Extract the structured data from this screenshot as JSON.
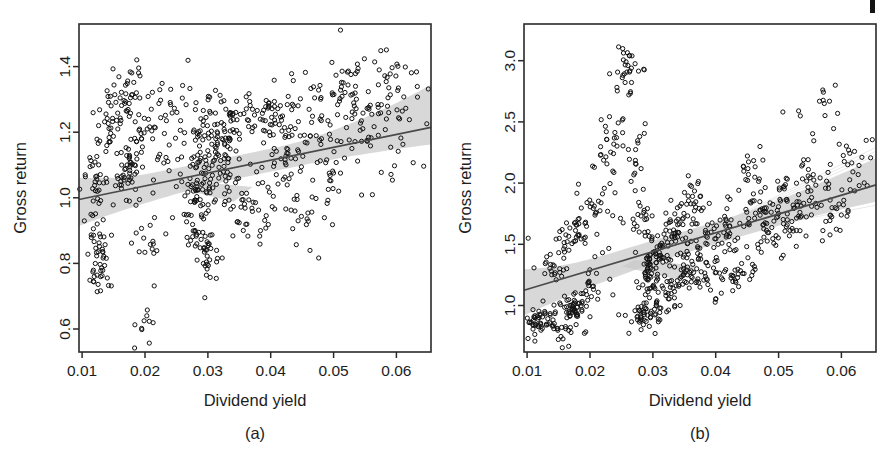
{
  "figure": {
    "background": "#ffffff",
    "point_color": "#121212",
    "line_color": "#4a4a4a",
    "band_color": "#c9c9c9",
    "width": 890,
    "height": 460,
    "scan_artifact": "scan-mark"
  },
  "panels": [
    {
      "id": "a",
      "caption": "(a)",
      "xlabel": "Dividend yield",
      "ylabel": "Gross return"
    },
    {
      "id": "b",
      "caption": "(b)",
      "xlabel": "Dividend yield",
      "ylabel": "Gross return"
    }
  ],
  "chart_data": [
    {
      "type": "scatter",
      "panel": "a",
      "title": "",
      "xlabel": "Dividend yield",
      "ylabel": "Gross return",
      "xlim": [
        0.0095,
        0.0655
      ],
      "ylim": [
        0.53,
        1.53
      ],
      "xticks": [
        0.01,
        0.02,
        0.03,
        0.04,
        0.05,
        0.06
      ],
      "xticklabels": [
        "0.01",
        "0.02",
        "0.03",
        "0.04",
        "0.05",
        "0.06"
      ],
      "yticks": [
        0.6,
        0.8,
        1.0,
        1.2,
        1.4
      ],
      "yticklabels": [
        "0.6",
        "0.8",
        "1.0",
        "1.2",
        "1.4"
      ],
      "grid": false,
      "legend": null,
      "marker": "open-circle",
      "n_points": 620,
      "fit": {
        "type": "linear",
        "x_start": 0.0095,
        "y_start": 0.995,
        "x_end": 0.0655,
        "y_end": 1.215
      },
      "confidence_band": {
        "description": "grey pointwise band around fit, widening at right edge",
        "lower_offset": -0.035,
        "upper_offset": 0.035,
        "right_upper_offset": 0.13
      },
      "clusters": [
        {
          "xc": 0.0118,
          "yc": 1.055,
          "xs": 0.0009,
          "ys": 0.055,
          "n": 26
        },
        {
          "xc": 0.0128,
          "yc": 0.855,
          "xs": 0.001,
          "ys": 0.055,
          "n": 30
        },
        {
          "xc": 0.0125,
          "yc": 0.745,
          "xs": 0.0008,
          "ys": 0.03,
          "n": 14
        },
        {
          "xc": 0.0142,
          "yc": 1.195,
          "xs": 0.001,
          "ys": 0.045,
          "n": 20
        },
        {
          "xc": 0.016,
          "yc": 1.275,
          "xs": 0.0012,
          "ys": 0.06,
          "n": 26
        },
        {
          "xc": 0.0172,
          "yc": 1.075,
          "xs": 0.0011,
          "ys": 0.055,
          "n": 48
        },
        {
          "xc": 0.018,
          "yc": 1.345,
          "xs": 0.0009,
          "ys": 0.045,
          "n": 16
        },
        {
          "xc": 0.0195,
          "yc": 1.245,
          "xs": 0.0013,
          "ys": 0.06,
          "n": 24
        },
        {
          "xc": 0.02,
          "yc": 0.885,
          "xs": 0.0012,
          "ys": 0.05,
          "n": 16
        },
        {
          "xc": 0.0205,
          "yc": 0.615,
          "xs": 0.001,
          "ys": 0.03,
          "n": 10
        },
        {
          "xc": 0.023,
          "yc": 1.175,
          "xs": 0.0014,
          "ys": 0.07,
          "n": 20
        },
        {
          "xc": 0.0255,
          "yc": 1.265,
          "xs": 0.0013,
          "ys": 0.065,
          "n": 16
        },
        {
          "xc": 0.0278,
          "yc": 0.915,
          "xs": 0.0012,
          "ys": 0.06,
          "n": 34
        },
        {
          "xc": 0.0288,
          "yc": 1.095,
          "xs": 0.0011,
          "ys": 0.07,
          "n": 54
        },
        {
          "xc": 0.03,
          "yc": 0.845,
          "xs": 0.0011,
          "ys": 0.055,
          "n": 28
        },
        {
          "xc": 0.0305,
          "yc": 1.245,
          "xs": 0.0013,
          "ys": 0.07,
          "n": 24
        },
        {
          "xc": 0.0318,
          "yc": 1.105,
          "xs": 0.0012,
          "ys": 0.07,
          "n": 46
        },
        {
          "xc": 0.0335,
          "yc": 1.225,
          "xs": 0.0013,
          "ys": 0.06,
          "n": 30
        },
        {
          "xc": 0.035,
          "yc": 0.965,
          "xs": 0.0014,
          "ys": 0.06,
          "n": 22
        },
        {
          "xc": 0.0372,
          "yc": 1.255,
          "xs": 0.0013,
          "ys": 0.06,
          "n": 22
        },
        {
          "xc": 0.0385,
          "yc": 0.965,
          "xs": 0.0013,
          "ys": 0.05,
          "n": 20
        },
        {
          "xc": 0.0405,
          "yc": 1.275,
          "xs": 0.0013,
          "ys": 0.055,
          "n": 26
        },
        {
          "xc": 0.042,
          "yc": 1.105,
          "xs": 0.0014,
          "ys": 0.065,
          "n": 24
        },
        {
          "xc": 0.044,
          "yc": 1.195,
          "xs": 0.0014,
          "ys": 0.06,
          "n": 22
        },
        {
          "xc": 0.0455,
          "yc": 0.955,
          "xs": 0.0014,
          "ys": 0.06,
          "n": 20
        },
        {
          "xc": 0.0478,
          "yc": 1.255,
          "xs": 0.0014,
          "ys": 0.06,
          "n": 22
        },
        {
          "xc": 0.0495,
          "yc": 1.095,
          "xs": 0.0014,
          "ys": 0.07,
          "n": 22
        },
        {
          "xc": 0.052,
          "yc": 1.285,
          "xs": 0.0015,
          "ys": 0.07,
          "n": 24
        },
        {
          "xc": 0.0545,
          "yc": 1.195,
          "xs": 0.0015,
          "ys": 0.075,
          "n": 22
        },
        {
          "xc": 0.0575,
          "yc": 1.325,
          "xs": 0.0016,
          "ys": 0.075,
          "n": 22
        },
        {
          "xc": 0.0605,
          "yc": 1.335,
          "xs": 0.0015,
          "ys": 0.08,
          "n": 20
        }
      ]
    },
    {
      "type": "scatter",
      "panel": "b",
      "title": "",
      "xlabel": "Dividend yield",
      "ylabel": "Gross return",
      "xlim": [
        0.0095,
        0.0655
      ],
      "ylim": [
        0.62,
        3.3
      ],
      "xticks": [
        0.01,
        0.02,
        0.03,
        0.04,
        0.05,
        0.06
      ],
      "xticklabels": [
        "0.01",
        "0.02",
        "0.03",
        "0.04",
        "0.05",
        "0.06"
      ],
      "yticks": [
        1.0,
        1.5,
        2.0,
        2.5,
        3.0
      ],
      "yticklabels": [
        "1.0",
        "1.5",
        "2.0",
        "2.5",
        "3.0"
      ],
      "grid": false,
      "legend": null,
      "marker": "open-circle",
      "n_points": 640,
      "fit": {
        "type": "linear",
        "x_start": 0.0095,
        "y_start": 1.125,
        "x_end": 0.0655,
        "y_end": 1.985
      },
      "confidence_band": {
        "description": "grey pointwise band around fit, widening at both ends",
        "lower_offset": -0.09,
        "upper_offset": 0.09,
        "right_upper_offset": 0.22
      },
      "clusters": [
        {
          "xc": 0.0112,
          "yc": 0.855,
          "xs": 0.0008,
          "ys": 0.045,
          "n": 26
        },
        {
          "xc": 0.0132,
          "yc": 0.905,
          "xs": 0.0009,
          "ys": 0.055,
          "n": 22
        },
        {
          "xc": 0.014,
          "yc": 1.285,
          "xs": 0.001,
          "ys": 0.06,
          "n": 16
        },
        {
          "xc": 0.0155,
          "yc": 0.785,
          "xs": 0.0009,
          "ys": 0.055,
          "n": 18
        },
        {
          "xc": 0.0162,
          "yc": 1.515,
          "xs": 0.0011,
          "ys": 0.08,
          "n": 18
        },
        {
          "xc": 0.0175,
          "yc": 0.975,
          "xs": 0.001,
          "ys": 0.055,
          "n": 44
        },
        {
          "xc": 0.0188,
          "yc": 1.625,
          "xs": 0.0011,
          "ys": 0.09,
          "n": 20
        },
        {
          "xc": 0.0196,
          "yc": 1.165,
          "xs": 0.001,
          "ys": 0.08,
          "n": 18
        },
        {
          "xc": 0.0212,
          "yc": 1.845,
          "xs": 0.0012,
          "ys": 0.1,
          "n": 18
        },
        {
          "xc": 0.0222,
          "yc": 2.165,
          "xs": 0.0009,
          "ys": 0.09,
          "n": 12
        },
        {
          "xc": 0.0235,
          "yc": 2.465,
          "xs": 0.0011,
          "ys": 0.13,
          "n": 14
        },
        {
          "xc": 0.0252,
          "yc": 2.735,
          "xs": 0.001,
          "ys": 0.14,
          "n": 14
        },
        {
          "xc": 0.0265,
          "yc": 2.925,
          "xs": 0.001,
          "ys": 0.17,
          "n": 18
        },
        {
          "xc": 0.0272,
          "yc": 2.285,
          "xs": 0.0009,
          "ys": 0.12,
          "n": 16
        },
        {
          "xc": 0.0278,
          "yc": 0.885,
          "xs": 0.0009,
          "ys": 0.06,
          "n": 24
        },
        {
          "xc": 0.0285,
          "yc": 1.755,
          "xs": 0.001,
          "ys": 0.11,
          "n": 18
        },
        {
          "xc": 0.0292,
          "yc": 1.325,
          "xs": 0.001,
          "ys": 0.09,
          "n": 34
        },
        {
          "xc": 0.03,
          "yc": 0.985,
          "xs": 0.001,
          "ys": 0.08,
          "n": 32
        },
        {
          "xc": 0.0312,
          "yc": 1.455,
          "xs": 0.0011,
          "ys": 0.11,
          "n": 40
        },
        {
          "xc": 0.0325,
          "yc": 1.185,
          "xs": 0.0011,
          "ys": 0.09,
          "n": 26
        },
        {
          "xc": 0.0338,
          "yc": 1.645,
          "xs": 0.0012,
          "ys": 0.11,
          "n": 40
        },
        {
          "xc": 0.0352,
          "yc": 1.255,
          "xs": 0.0012,
          "ys": 0.1,
          "n": 22
        },
        {
          "xc": 0.0365,
          "yc": 1.855,
          "xs": 0.0012,
          "ys": 0.09,
          "n": 22
        },
        {
          "xc": 0.0372,
          "yc": 1.295,
          "xs": 0.0011,
          "ys": 0.09,
          "n": 26
        },
        {
          "xc": 0.039,
          "yc": 1.605,
          "xs": 0.0013,
          "ys": 0.1,
          "n": 24
        },
        {
          "xc": 0.0402,
          "yc": 1.175,
          "xs": 0.0012,
          "ys": 0.09,
          "n": 20
        },
        {
          "xc": 0.0422,
          "yc": 1.605,
          "xs": 0.0013,
          "ys": 0.1,
          "n": 26
        },
        {
          "xc": 0.0438,
          "yc": 1.285,
          "xs": 0.0013,
          "ys": 0.09,
          "n": 20
        },
        {
          "xc": 0.0455,
          "yc": 2.055,
          "xs": 0.0013,
          "ys": 0.09,
          "n": 18
        },
        {
          "xc": 0.0468,
          "yc": 1.745,
          "xs": 0.0013,
          "ys": 0.09,
          "n": 20
        },
        {
          "xc": 0.0488,
          "yc": 1.575,
          "xs": 0.0014,
          "ys": 0.11,
          "n": 26
        },
        {
          "xc": 0.0508,
          "yc": 1.905,
          "xs": 0.0014,
          "ys": 0.1,
          "n": 22
        },
        {
          "xc": 0.0525,
          "yc": 1.685,
          "xs": 0.0014,
          "ys": 0.1,
          "n": 24
        },
        {
          "xc": 0.0552,
          "yc": 1.985,
          "xs": 0.0014,
          "ys": 0.11,
          "n": 22
        },
        {
          "xc": 0.0572,
          "yc": 2.565,
          "xs": 0.0013,
          "ys": 0.16,
          "n": 12
        },
        {
          "xc": 0.0585,
          "yc": 1.795,
          "xs": 0.0014,
          "ys": 0.11,
          "n": 20
        },
        {
          "xc": 0.0612,
          "yc": 2.085,
          "xs": 0.0014,
          "ys": 0.14,
          "n": 16
        }
      ]
    }
  ]
}
